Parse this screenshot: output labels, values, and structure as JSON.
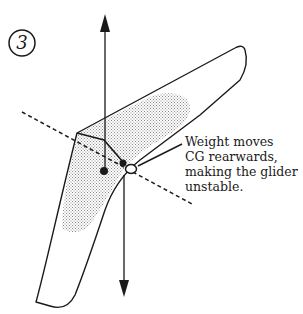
{
  "figure": {
    "step_number": "3",
    "annotation": {
      "lines": [
        "Weight moves",
        "CG rearwards,",
        "making the glider",
        "unstable."
      ]
    },
    "elements": {
      "lift_vector": "upward arrow",
      "weight_vector": "downward arrow",
      "pitch_axis": "dashed line",
      "center_of_pressure": "filled dot",
      "center_of_gravity": "filled dot",
      "pilot_weight_point": "open circle"
    },
    "colors": {
      "ink": "#1a1a1a",
      "shading": "#b8b8b8",
      "background": "#ffffff"
    }
  }
}
